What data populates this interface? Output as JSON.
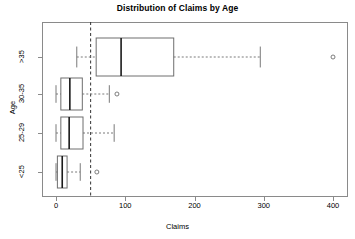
{
  "chart_data": {
    "type": "boxplot",
    "title": "Distribution of Claims by Age",
    "xlabel": "Claims",
    "ylabel": "Age",
    "orientation": "horizontal",
    "xlim": [
      -20,
      420
    ],
    "xticks": [
      0,
      100,
      200,
      300,
      400
    ],
    "xtick_labels": [
      "0",
      "100",
      "200",
      "300",
      "400"
    ],
    "categories": [
      "<25",
      "25-29",
      "30-35",
      ">35"
    ],
    "category_order_top_to_bottom": [
      ">35",
      "30-35",
      "25-29",
      "<25"
    ],
    "grid": false,
    "legend": null,
    "reference_line": {
      "value": 50,
      "orientation": "vertical",
      "style": "dashed",
      "color": "#333333"
    },
    "boxes": [
      {
        "category": ">35",
        "whisker_low": 30,
        "q1": 58,
        "median": 94,
        "q3": 170,
        "whisker_high": 295,
        "outliers": [
          400
        ]
      },
      {
        "category": "30-35",
        "whisker_low": 0,
        "q1": 7,
        "median": 20,
        "q3": 38,
        "whisker_high": 77,
        "outliers": [
          88
        ]
      },
      {
        "category": "25-29",
        "whisker_low": 0,
        "q1": 7,
        "median": 19,
        "q3": 39,
        "whisker_high": 84,
        "outliers": []
      },
      {
        "category": "<25",
        "whisker_low": 0,
        "q1": 2,
        "median": 9,
        "q3": 16,
        "whisker_high": 35,
        "outliers": [
          59
        ]
      }
    ],
    "colors": {
      "box_stroke": "#6e6e6e",
      "median_stroke": "#1a1a1a",
      "whisker_stroke": "#7a7a7a",
      "outlier_stroke": "#6e6e6e",
      "axis": "#8a8a8a",
      "reference_line": "#333333",
      "background": "#ffffff"
    }
  }
}
